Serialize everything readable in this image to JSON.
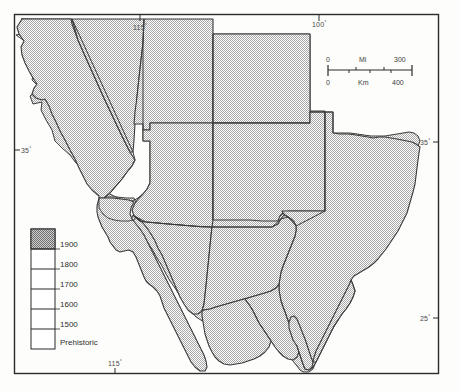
{
  "map": {
    "title": "Southwestern United States and Northern Mexico",
    "frame": {
      "stroke": "#2b2b2b",
      "fill": "#ffffff"
    },
    "land_fill_color": "#c9c9c9",
    "land_stroke_color": "#3a3a3a",
    "background_color": "#ffffff"
  },
  "graticule": {
    "top": [
      {
        "name": "lon-115-top",
        "label": "115",
        "degree": "°",
        "x": 138,
        "y": 26,
        "tick_x": 140,
        "tick_y0": 17,
        "tick_y1": 22
      },
      {
        "name": "lon-100-top",
        "label": "100",
        "degree": "°",
        "x": 316,
        "y": 24,
        "tick_x": 319,
        "tick_y0": 15,
        "tick_y1": 20
      }
    ],
    "bottom": [
      {
        "name": "lon-115-bottom",
        "label": "115",
        "degree": "°",
        "x": 112,
        "y": 372,
        "tick_x": 115,
        "tick_y0": 374,
        "tick_y1": 379
      }
    ],
    "left": [
      {
        "name": "lat-35-left",
        "label": "35",
        "degree": "°",
        "x": 18,
        "y": 153,
        "tick_x0": 15,
        "tick_x1": 20,
        "tick_y": 150
      }
    ],
    "right": [
      {
        "name": "lat-35-right",
        "label": "35",
        "degree": "°",
        "x": 428,
        "y": 145,
        "tick_x0": 435,
        "tick_x1": 441,
        "tick_y": 142
      },
      {
        "name": "lat-25-right",
        "label": "25",
        "degree": "°",
        "x": 428,
        "y": 321,
        "tick_x0": 435,
        "tick_x1": 441,
        "tick_y": 318
      }
    ]
  },
  "scale_bar": {
    "name": "scale-bar",
    "miles": {
      "unit_label": "Mi",
      "start_label": "0",
      "end_label": "300"
    },
    "kilometers": {
      "unit_label": "Km",
      "start_label": "0",
      "end_label": "400"
    }
  },
  "legend": {
    "name": "date-legend",
    "title": "",
    "entries": [
      {
        "label": "1900",
        "shaded": true
      },
      {
        "label": "1800",
        "shaded": false
      },
      {
        "label": "1700",
        "shaded": false
      },
      {
        "label": "1600",
        "shaded": false
      },
      {
        "label": "1500",
        "shaded": false
      },
      {
        "label": "Prehistoric",
        "shaded": false
      }
    ]
  },
  "regions": [
    {
      "name": "california",
      "label": "California"
    },
    {
      "name": "nevada",
      "label": "Nevada"
    },
    {
      "name": "utah",
      "label": "Utah"
    },
    {
      "name": "colorado",
      "label": "Colorado"
    },
    {
      "name": "arizona",
      "label": "Arizona"
    },
    {
      "name": "new-mexico",
      "label": "New Mexico"
    },
    {
      "name": "texas",
      "label": "Texas"
    },
    {
      "name": "baja-california",
      "label": "Baja California"
    },
    {
      "name": "sonora",
      "label": "Sonora"
    },
    {
      "name": "chihuahua",
      "label": "Chihuahua"
    },
    {
      "name": "coahuila",
      "label": "Coahuila"
    },
    {
      "name": "nuevo-leon",
      "label": "Nuevo León"
    },
    {
      "name": "tamaulipas",
      "label": "Tamaulipas"
    },
    {
      "name": "durango",
      "label": "Durango"
    }
  ]
}
